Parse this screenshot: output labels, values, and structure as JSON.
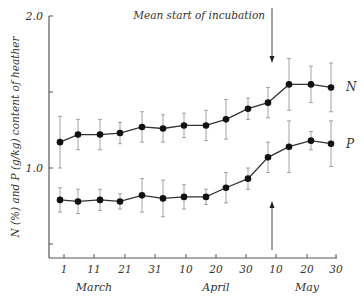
{
  "chart_data": {
    "type": "line",
    "title": "",
    "xlabel": "",
    "ylabel": "N (%) and P (g/kg) content of heather",
    "ylim": [
      0.41,
      2.0
    ],
    "yticks": [
      {
        "value": 2.0,
        "label": "2.0"
      },
      {
        "value": 1.5,
        "label": ""
      },
      {
        "value": 1.0,
        "label": "1.0"
      },
      {
        "value": 0.5,
        "label": ""
      }
    ],
    "xticks": [
      {
        "pos": 64,
        "label": "1"
      },
      {
        "pos": 94,
        "label": "11"
      },
      {
        "pos": 125,
        "label": "21"
      },
      {
        "pos": 155,
        "label": "31"
      },
      {
        "pos": 186,
        "label": "10"
      },
      {
        "pos": 216,
        "label": "20"
      },
      {
        "pos": 246,
        "label": "30"
      },
      {
        "pos": 276,
        "label": "10"
      },
      {
        "pos": 307,
        "label": "20"
      },
      {
        "pos": 336,
        "label": "30"
      }
    ],
    "month_labels": [
      {
        "label": "March",
        "pos": 94
      },
      {
        "label": "April",
        "pos": 216
      },
      {
        "label": "May",
        "pos": 307
      }
    ],
    "x_px": [
      60,
      78,
      100,
      120,
      142,
      163,
      184,
      206,
      226,
      248,
      268,
      289,
      311,
      331
    ],
    "series": [
      {
        "name": "N",
        "values": [
          1.17,
          1.22,
          1.22,
          1.23,
          1.27,
          1.26,
          1.28,
          1.28,
          1.32,
          1.39,
          1.43,
          1.55,
          1.55,
          1.53
        ],
        "err": [
          0.17,
          0.1,
          0.1,
          0.07,
          0.1,
          0.09,
          0.08,
          0.1,
          0.13,
          0.07,
          0.1,
          0.17,
          0.12,
          0.16
        ]
      },
      {
        "name": "P",
        "values": [
          0.79,
          0.78,
          0.79,
          0.78,
          0.82,
          0.8,
          0.81,
          0.81,
          0.87,
          0.93,
          1.07,
          1.14,
          1.18,
          1.16
        ],
        "err": [
          0.08,
          0.08,
          0.07,
          0.05,
          0.11,
          0.12,
          0.08,
          0.05,
          0.1,
          0.07,
          0.1,
          0.17,
          0.06,
          0.15
        ]
      }
    ],
    "annotations": [
      {
        "text": "Mean start of incubation",
        "arrow": "down",
        "x_px": 272
      },
      {
        "text": "",
        "arrow": "up",
        "x_px": 272
      }
    ],
    "grid": false,
    "legend": "inline labels N and P at right"
  }
}
